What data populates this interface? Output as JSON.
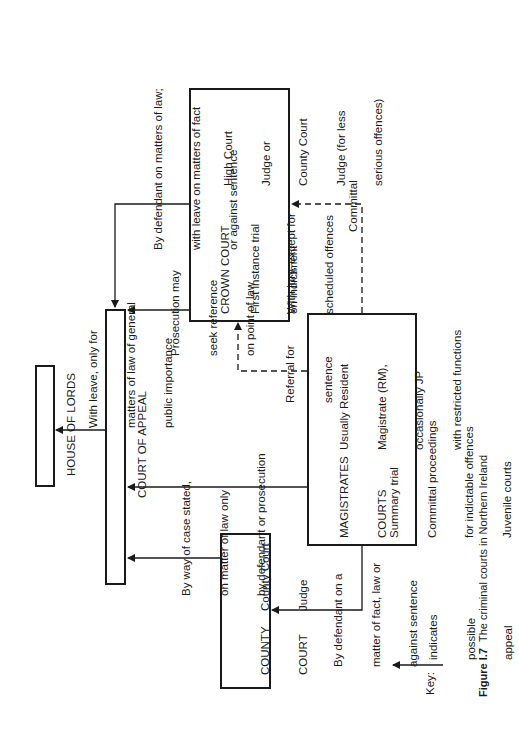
{
  "figure": {
    "label": "Figure I.7",
    "caption": "The criminal courts in Northern Ireland"
  },
  "courts": {
    "house_of_lords": {
      "name": "HOUSE OF LORDS"
    },
    "court_of_appeal": {
      "name": "COURT OF APPEAL"
    },
    "crown_court": {
      "name": "CROWN COURT",
      "function_lines": [
        "First instance trial",
        "on indictment"
      ],
      "jury_lines": [
        "With jury, except for",
        "scheduled offences"
      ],
      "judges_lines": [
        "High Court",
        "Judge or",
        "County Court",
        "Judge (for less",
        "serious offences)"
      ]
    },
    "magistrates_courts": {
      "name_lines": [
        "MAGISTRATES",
        "COURTS"
      ],
      "functions_lines": [
        "Summary trial",
        "Committal proceedings",
        "for indictable offences",
        "Juvenile courts"
      ],
      "judges_lines": [
        "Usually Resident",
        "Magistrate (RM),",
        "occasionally JP",
        "with restricted functions"
      ]
    },
    "county_court": {
      "name_lines": [
        "COUNTY",
        "COURT"
      ],
      "judge_lines": [
        "County Court",
        "Judge"
      ]
    }
  },
  "edges": {
    "coa_to_hol": [
      "With leave, only for",
      "matters of law of general",
      "public importance"
    ],
    "crown_to_coa_defendant": [
      "By defendant on matters of law;",
      "with leave on matters of fact",
      "or against sentence"
    ],
    "crown_to_coa_prosecution": [
      "Prosecution may",
      "seek reference",
      "on point of law"
    ],
    "magistrates_to_crown_committal": [
      "Committal"
    ],
    "magistrates_to_crown_referral": [
      "Referral for",
      "sentence"
    ],
    "county_to_coa_case_stated": [
      "By way of case stated,",
      "on matter of law only",
      "by defendant or prosecution"
    ],
    "magistrates_to_county": [
      "By defendant on a",
      "matter of fact, law or",
      "against sentence"
    ]
  },
  "key": {
    "label": "Key:",
    "description_lines": [
      "indicates",
      "possible",
      "appeal"
    ]
  },
  "colors": {
    "ink": "#1a1a1a",
    "background": "#ffffff"
  }
}
